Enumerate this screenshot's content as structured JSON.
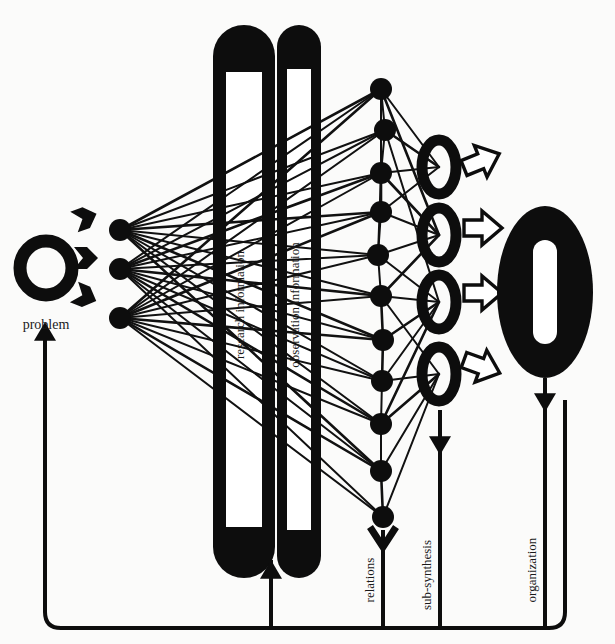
{
  "diagram": {
    "title_visible": false,
    "style": {
      "ink": "#0d0d0d",
      "paper": "#fbfbfa",
      "line_color": "#111111"
    },
    "labels": {
      "problem": "problem",
      "research_information": "research information",
      "observation_information": "observation information",
      "relations": "relations",
      "sub_synthesis": "sub-synthesis",
      "organization": "organization"
    },
    "nodes": {
      "problem_ring": {
        "name": "problem-ring",
        "cx": 46,
        "cy": 268,
        "rx": 26,
        "ry": 27,
        "stroke": 13
      },
      "input_arrows": [
        {
          "name": "problem-arrow-1",
          "x": 74,
          "y": 222
        },
        {
          "name": "problem-arrow-2",
          "x": 74,
          "y": 258
        },
        {
          "name": "problem-arrow-3",
          "x": 74,
          "y": 292
        }
      ],
      "source_nodes": [
        {
          "name": "source-node-1",
          "cx": 120,
          "cy": 230,
          "r": 11
        },
        {
          "name": "source-node-2",
          "cx": 120,
          "cy": 269,
          "r": 11
        },
        {
          "name": "source-node-3",
          "cx": 120,
          "cy": 318,
          "r": 11
        }
      ],
      "relation_nodes": [
        {
          "name": "relation-node-1",
          "cx": 381,
          "cy": 89,
          "r": 11
        },
        {
          "name": "relation-node-2",
          "cx": 385,
          "cy": 130,
          "r": 11
        },
        {
          "name": "relation-node-3",
          "cx": 381,
          "cy": 173,
          "r": 11
        },
        {
          "name": "relation-node-4",
          "cx": 381,
          "cy": 212,
          "r": 11
        },
        {
          "name": "relation-node-5",
          "cx": 378,
          "cy": 255,
          "r": 11
        },
        {
          "name": "relation-node-6",
          "cx": 381,
          "cy": 296,
          "r": 11
        },
        {
          "name": "relation-node-7",
          "cx": 383,
          "cy": 340,
          "r": 11
        },
        {
          "name": "relation-node-8",
          "cx": 382,
          "cy": 381,
          "r": 11
        },
        {
          "name": "relation-node-9",
          "cx": 381,
          "cy": 424,
          "r": 11
        },
        {
          "name": "relation-node-10",
          "cx": 381,
          "cy": 471,
          "r": 11
        },
        {
          "name": "relation-node-11",
          "cx": 383,
          "cy": 517,
          "r": 11
        }
      ],
      "sub_synthesis_rings": [
        {
          "name": "sub-synthesis-ring-1",
          "cx": 439,
          "cy": 167,
          "rx": 17,
          "ry": 27
        },
        {
          "name": "sub-synthesis-ring-2",
          "cx": 439,
          "cy": 235,
          "rx": 17,
          "ry": 27
        },
        {
          "name": "sub-synthesis-ring-3",
          "cx": 439,
          "cy": 302,
          "rx": 17,
          "ry": 27
        },
        {
          "name": "sub-synthesis-ring-4",
          "cx": 439,
          "cy": 374,
          "rx": 17,
          "ry": 27
        }
      ],
      "hollow_arrows": [
        {
          "name": "hollow-arrow-1",
          "x": 464,
          "y": 168,
          "angle": -22
        },
        {
          "name": "hollow-arrow-2",
          "x": 464,
          "y": 228,
          "angle": 0
        },
        {
          "name": "hollow-arrow-3",
          "x": 464,
          "y": 293,
          "angle": 0
        },
        {
          "name": "hollow-arrow-4",
          "x": 464,
          "y": 360,
          "angle": 20
        }
      ],
      "organization_o": {
        "name": "organization-big-o",
        "cx": 545,
        "cy": 292,
        "rx": 48,
        "ry": 86,
        "inner_rx": 12,
        "inner_ry": 52
      }
    },
    "pillars": [
      {
        "name": "pillar-research-information",
        "x": 213,
        "y": 25,
        "w": 62,
        "h": 553,
        "label_x": 244,
        "label_y": 305
      },
      {
        "name": "pillar-observation-information",
        "x": 277,
        "y": 25,
        "w": 44,
        "h": 553,
        "label_x": 299,
        "label_y": 305
      }
    ],
    "feedback_rail": {
      "name": "feedback-rail",
      "y": 628,
      "x_left": 45,
      "x_right": 565,
      "branches": [
        {
          "name": "feedback-branch-problem",
          "x": 45,
          "arrow_y": 325,
          "label": "problem",
          "direction": "up"
        },
        {
          "name": "feedback-branch-pillars",
          "x": 271,
          "arrow_y": 562,
          "label": "",
          "direction": "up"
        },
        {
          "name": "feedback-branch-relations",
          "x": 383,
          "arrow_y": 530,
          "label": "relations",
          "direction": "down"
        },
        {
          "name": "feedback-branch-sub-synthesis",
          "x": 440,
          "arrow_y": 410,
          "label": "sub-synthesis",
          "direction": "down"
        },
        {
          "name": "feedback-branch-organization",
          "x": 545,
          "arrow_y": 385,
          "label": "organization",
          "direction": "down"
        }
      ]
    },
    "edges_fan_left": [
      [
        120,
        230,
        381,
        89
      ],
      [
        120,
        230,
        385,
        130
      ],
      [
        120,
        230,
        381,
        173
      ],
      [
        120,
        230,
        381,
        212
      ],
      [
        120,
        230,
        378,
        255
      ],
      [
        120,
        230,
        381,
        296
      ],
      [
        120,
        230,
        383,
        340
      ],
      [
        120,
        230,
        382,
        381
      ],
      [
        120,
        230,
        381,
        424
      ],
      [
        120,
        230,
        381,
        471
      ],
      [
        120,
        269,
        381,
        89
      ],
      [
        120,
        269,
        385,
        130
      ],
      [
        120,
        269,
        381,
        173
      ],
      [
        120,
        269,
        381,
        212
      ],
      [
        120,
        269,
        378,
        255
      ],
      [
        120,
        269,
        381,
        296
      ],
      [
        120,
        269,
        383,
        340
      ],
      [
        120,
        269,
        382,
        381
      ],
      [
        120,
        269,
        381,
        424
      ],
      [
        120,
        269,
        381,
        471
      ],
      [
        120,
        269,
        383,
        517
      ],
      [
        120,
        318,
        381,
        89
      ],
      [
        120,
        318,
        385,
        130
      ],
      [
        120,
        318,
        381,
        173
      ],
      [
        120,
        318,
        381,
        212
      ],
      [
        120,
        318,
        378,
        255
      ],
      [
        120,
        318,
        381,
        296
      ],
      [
        120,
        318,
        383,
        340
      ],
      [
        120,
        318,
        382,
        381
      ],
      [
        120,
        318,
        381,
        424
      ],
      [
        120,
        318,
        381,
        471
      ],
      [
        120,
        318,
        383,
        517
      ]
    ],
    "edges_fan_right": [
      [
        381,
        89,
        439,
        167
      ],
      [
        385,
        130,
        439,
        167
      ],
      [
        381,
        173,
        439,
        167
      ],
      [
        381,
        212,
        439,
        167
      ],
      [
        381,
        173,
        439,
        235
      ],
      [
        381,
        212,
        439,
        235
      ],
      [
        378,
        255,
        439,
        235
      ],
      [
        381,
        296,
        439,
        235
      ],
      [
        378,
        255,
        439,
        302
      ],
      [
        381,
        296,
        439,
        302
      ],
      [
        383,
        340,
        439,
        302
      ],
      [
        382,
        381,
        439,
        302
      ],
      [
        382,
        381,
        439,
        374
      ],
      [
        381,
        424,
        439,
        374
      ],
      [
        381,
        471,
        439,
        374
      ],
      [
        383,
        517,
        439,
        374
      ],
      [
        381,
        89,
        439,
        235
      ],
      [
        381,
        296,
        439,
        374
      ],
      [
        385,
        130,
        439,
        302
      ],
      [
        381,
        424,
        439,
        302
      ]
    ],
    "edges_inter_relations": [
      [
        381,
        89,
        385,
        130
      ],
      [
        385,
        130,
        381,
        173
      ],
      [
        381,
        173,
        381,
        212
      ],
      [
        381,
        212,
        378,
        255
      ],
      [
        378,
        255,
        381,
        296
      ],
      [
        383,
        340,
        382,
        381
      ],
      [
        382,
        381,
        381,
        424
      ],
      [
        381,
        424,
        381,
        471
      ],
      [
        381,
        471,
        383,
        517
      ],
      [
        381,
        89,
        381,
        212
      ],
      [
        381,
        173,
        378,
        255
      ],
      [
        381,
        296,
        383,
        340
      ]
    ]
  }
}
